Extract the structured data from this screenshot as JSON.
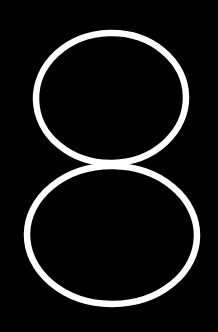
{
  "scene": {
    "name": "figure-eight-outline",
    "description": "Large white outlined numeral eight on a solid black background",
    "width": 218,
    "height": 332,
    "background_color": "#000000",
    "stroke_color": "#ffffff",
    "stroke_width": 6.5,
    "glyph_character": "8",
    "style": "outline",
    "caption": "8"
  },
  "shapes": {
    "upper_loop": {
      "name": "upper-loop",
      "type": "ellipse",
      "cx": 111,
      "cy": 98,
      "rx": 75,
      "ry": 65,
      "stroke_color": "#ffffff",
      "stroke_width": 6.5,
      "fill": "none",
      "rotation": -1.5
    },
    "lower_loop": {
      "name": "lower-loop",
      "type": "ellipse",
      "cx": 112,
      "cy": 235,
      "rx": 85,
      "ry": 69,
      "stroke_color": "#ffffff",
      "stroke_width": 6.5,
      "fill": "none",
      "rotation": 0.5
    }
  },
  "bounds": {
    "upper_loop": {
      "left": 33,
      "top": 30,
      "right": 189,
      "bottom": 166
    },
    "lower_loop": {
      "left": 24,
      "top": 163,
      "right": 200,
      "bottom": 307
    },
    "waist_y": 164
  }
}
